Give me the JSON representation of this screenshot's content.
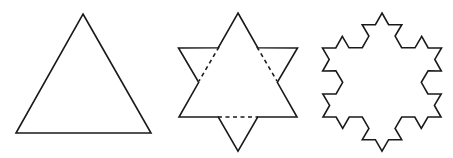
{
  "figure": {
    "stroke_color": "#1a1a1a",
    "background": "#ffffff"
  },
  "shapes": [
    {
      "name": "triangle-iteration-0",
      "type": "polygon",
      "points": [
        [
          83,
          14
        ],
        [
          151,
          133
        ],
        [
          16,
          133
        ]
      ]
    },
    {
      "name": "star-iteration-1",
      "base_triangle": {
        "apex": [
          238,
          13
        ],
        "base_left": [
          179,
          117
        ],
        "base_right": [
          297,
          117
        ]
      },
      "iterations": 1,
      "dashed_segments": [
        [
          [
            219,
            47
          ],
          [
            199,
            81
          ]
        ],
        [
          [
            257,
            47
          ],
          [
            277,
            81
          ]
        ],
        [
          [
            218,
            117
          ],
          [
            258,
            117
          ]
        ]
      ]
    },
    {
      "name": "snowflake-iteration-2",
      "base_triangle": {
        "apex": [
          382,
          13
        ],
        "base_left": [
          323,
          117
        ],
        "base_right": [
          441,
          117
        ]
      },
      "iterations": 2
    }
  ]
}
